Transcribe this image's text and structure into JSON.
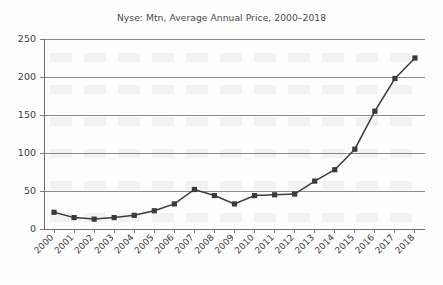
{
  "chart_data": {
    "type": "line",
    "title": "Nyse: Mtn, Average Annual Price, 2000–2018",
    "xlabel": "",
    "ylabel": "",
    "categories": [
      "2000",
      "2001",
      "2002",
      "2003",
      "2004",
      "2005",
      "2006",
      "2007",
      "2008",
      "2009",
      "2010",
      "2011",
      "2012",
      "2013",
      "2014",
      "2015",
      "2016",
      "2017",
      "2018"
    ],
    "values": [
      22,
      15,
      13,
      15,
      18,
      24,
      33,
      52,
      44,
      33,
      44,
      45,
      46,
      63,
      78,
      105,
      155,
      198,
      225
    ],
    "series": [
      {
        "name": "Average Annual Price",
        "values": [
          22,
          15,
          13,
          15,
          18,
          24,
          33,
          52,
          44,
          33,
          44,
          45,
          46,
          63,
          78,
          105,
          155,
          198,
          225
        ]
      }
    ],
    "ylim": [
      0,
      250
    ],
    "yticks": [
      0,
      50,
      100,
      150,
      200,
      250
    ],
    "ytick_labels": [
      "0",
      "50",
      "100",
      "150",
      "200",
      "250"
    ],
    "xtick_labels": [
      "2000",
      "2001",
      "2002",
      "2003",
      "2004",
      "2005",
      "2006",
      "2007",
      "2008",
      "2009",
      "2010",
      "2011",
      "2012",
      "2013",
      "2014",
      "2015",
      "2016",
      "2017",
      "2018"
    ],
    "grid": true,
    "grid_axis": "y",
    "legend": false,
    "legend_position": "none",
    "marker": "square",
    "line_color": "#3b3b3b",
    "marker_color": "#3b3b3b",
    "grid_color": "#6e6e6e",
    "background_color": "#fdfdfd",
    "text_color": "#3d3d3d"
  },
  "figure": {
    "title": "Nyse: Mtn, Average Annual Price, 2000–2018"
  }
}
